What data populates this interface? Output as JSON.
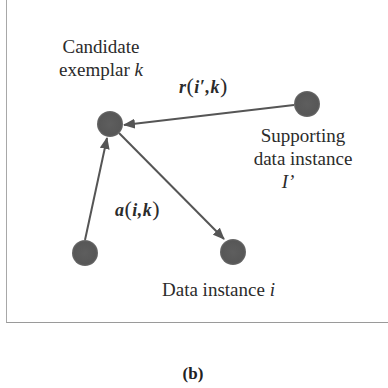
{
  "figure": {
    "caption": "(b)",
    "nodes": {
      "exemplar": {
        "label_line1": "Candidate",
        "label_line2_text": "exemplar ",
        "label_line2_var": "k"
      },
      "supporting": {
        "label_line1": "Supporting",
        "label_line2": "data instance",
        "label_var": "I’"
      },
      "source": {
        "label": ""
      },
      "target": {
        "label_text": "Data instance ",
        "label_var": "i"
      }
    },
    "edges": {
      "responsibility": {
        "func": "r",
        "open": "(",
        "args": "i′,k",
        "close": ")"
      },
      "availability": {
        "func": "a",
        "open": "(",
        "args": "i,k",
        "close": ")"
      }
    },
    "colors": {
      "node": "#5a5a5a",
      "edge": "#555555",
      "text": "#2b2b2b"
    }
  }
}
